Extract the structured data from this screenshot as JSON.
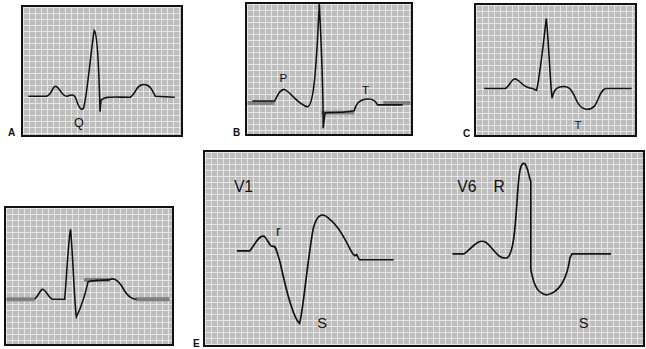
{
  "figure": {
    "panels": [
      {
        "id": "A",
        "label": "A",
        "annotations": [
          "Q"
        ]
      },
      {
        "id": "B",
        "label": "B",
        "annotations": [
          "P",
          "T"
        ]
      },
      {
        "id": "C",
        "label": "C",
        "annotations": [
          "T"
        ]
      },
      {
        "id": "D",
        "label": "",
        "annotations": []
      },
      {
        "id": "E",
        "label": "E",
        "leads": [
          {
            "name": "V1",
            "annotations": [
              "r",
              "S"
            ]
          },
          {
            "name": "V6",
            "annotations": [
              "R",
              "S"
            ]
          }
        ]
      }
    ]
  },
  "colors": {
    "grid_bg": "#bdbdbd",
    "grid_line": "#e6e6e6",
    "trace": "#111111",
    "baseline_marker": "#808080"
  }
}
